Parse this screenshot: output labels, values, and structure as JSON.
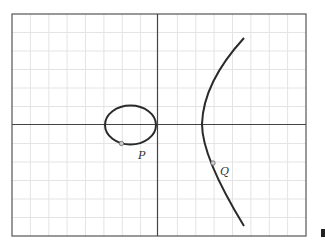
{
  "figure": {
    "grid": {
      "columns": 16,
      "rows": 12,
      "color": "#e6e6e6"
    },
    "axes": {
      "color": "#444444"
    },
    "curve": {
      "color": "#2a2a2a",
      "components": [
        "oval",
        "unbounded branch"
      ]
    },
    "points": [
      {
        "id": "P",
        "label": "P"
      },
      {
        "id": "Q",
        "label": "Q"
      }
    ]
  }
}
